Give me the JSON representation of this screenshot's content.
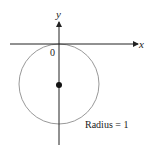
{
  "diagram": {
    "x_axis_label": "x",
    "y_axis_label": "y",
    "origin_label": "0",
    "annotation": "Radius = 1",
    "circle": {
      "center": [
        0,
        -1
      ],
      "radius": 1
    },
    "colors": {
      "axis": "#222222",
      "circle": "#999999",
      "center_point": "#111111"
    }
  }
}
